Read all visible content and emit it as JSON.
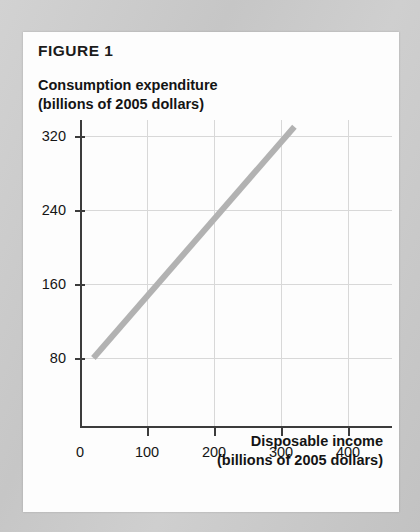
{
  "figure": {
    "title": "FIGURE 1"
  },
  "axis_titles": {
    "y_line1": "Consumption expenditure",
    "y_line2": "(billions of 2005 dollars)",
    "x_line1": "Disposable income",
    "x_line2": "(billions of 2005 dollars)"
  },
  "colors": {
    "line": "#b2b2b2",
    "axis": "#3c3c3c",
    "grid": "#d8d8d8",
    "card": "#fdfdfd",
    "page": "#c8c8c8",
    "text": "#151515"
  },
  "chart_data": {
    "type": "line",
    "title": "FIGURE 1",
    "xlabel": "Disposable income (billions of 2005 dollars)",
    "ylabel": "Consumption expenditure (billions of 2005 dollars)",
    "xlim": [
      0,
      440
    ],
    "ylim": [
      0,
      360
    ],
    "xticks": [
      0,
      100,
      200,
      300,
      400
    ],
    "xtick_labels": [
      "0",
      "100",
      "200",
      "300",
      "400"
    ],
    "yticks": [
      80,
      160,
      240,
      320
    ],
    "ytick_labels": [
      "80",
      "160",
      "240",
      "320"
    ],
    "grid": true,
    "legend": null,
    "series": [
      {
        "name": "Consumption function",
        "color": "#b2b2b2",
        "x": [
          20,
          320
        ],
        "y": [
          80,
          330
        ],
        "points": [
          {
            "x": 20,
            "y": 80
          },
          {
            "x": 100,
            "y": 147
          },
          {
            "x": 200,
            "y": 230
          },
          {
            "x": 300,
            "y": 313
          },
          {
            "x": 320,
            "y": 330
          }
        ],
        "slope": 0.833,
        "intercept": 63.3
      }
    ]
  }
}
